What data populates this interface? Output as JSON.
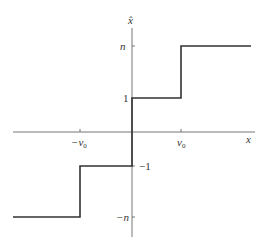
{
  "diagram": {
    "type": "step-function",
    "axes": {
      "x_label": "x",
      "y_label": "x̂",
      "x_ticks": [
        {
          "label": "−v₀",
          "value": "-v0"
        },
        {
          "label": "v₀",
          "value": "v0"
        }
      ],
      "y_ticks": [
        {
          "label": "n",
          "value": "n"
        },
        {
          "label": "1",
          "value": "1"
        },
        {
          "label": "−1",
          "value": "-1"
        },
        {
          "label": "−n",
          "value": "-n"
        }
      ]
    },
    "segments": [
      {
        "x_range": [
          "-inf",
          "-v0"
        ],
        "y": "-n"
      },
      {
        "x_range": [
          "-v0",
          "0"
        ],
        "y": "-1"
      },
      {
        "x_range": [
          "0",
          "v0"
        ],
        "y": "1"
      },
      {
        "x_range": [
          "v0",
          "inf"
        ],
        "y": "n"
      }
    ],
    "colors": {
      "axis": "#555555",
      "curve": "#333333"
    }
  },
  "labels": {
    "x_axis": "x",
    "y_axis": "x̂",
    "tick_neg_v0": "−v",
    "tick_neg_v0_sub": "0",
    "tick_v0": "v",
    "tick_v0_sub": "0",
    "tick_n": "n",
    "tick_1": "1",
    "tick_neg1": "−1",
    "tick_negn": "−n"
  }
}
